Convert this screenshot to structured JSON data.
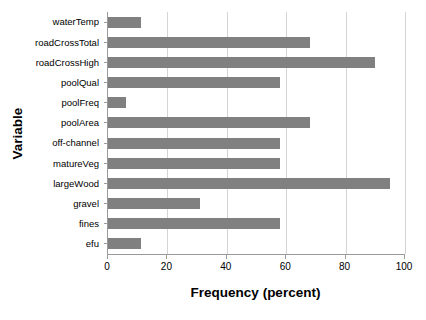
{
  "chart_data": {
    "type": "bar",
    "orientation": "horizontal",
    "title": "",
    "xlabel": "Frequency (percent)",
    "ylabel": "Variable",
    "xlim": [
      0,
      100
    ],
    "xticks": [
      0,
      20,
      40,
      60,
      80,
      100
    ],
    "xtick_labels": [
      "0",
      "20",
      "40",
      "60",
      "80",
      "100"
    ],
    "grid": "vertical",
    "legend": "none",
    "bar_color": "#808080",
    "axis_color": "#9a9a9a",
    "gridline_color": "#d4d4d4",
    "background": "#ffffff",
    "categories": [
      "waterTemp",
      "roadCrossTotal",
      "roadCrossHigh",
      "poolQual",
      "poolFreq",
      "poolArea",
      "off-channel",
      "matureVeg",
      "largeWood",
      "gravel",
      "fines",
      "efu"
    ],
    "values": [
      11,
      68,
      90,
      58,
      6,
      68,
      58,
      58,
      95,
      31,
      58,
      11
    ]
  }
}
